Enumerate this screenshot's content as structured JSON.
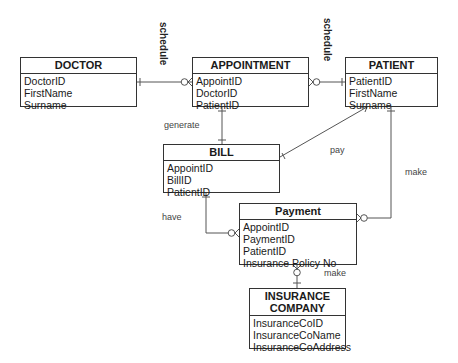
{
  "diagram": {
    "type": "entity-relationship",
    "entities": [
      {
        "id": "doctor",
        "title": "DOCTOR",
        "attributes": [
          "DoctorID",
          "FirstName",
          "Surname"
        ]
      },
      {
        "id": "appointment",
        "title": "APPOINTMENT",
        "attributes": [
          "AppointID",
          "DoctorID",
          "PatientID"
        ]
      },
      {
        "id": "patient",
        "title": "PATIENT",
        "attributes": [
          "PatientID",
          "FirstName",
          "Surname"
        ]
      },
      {
        "id": "bill",
        "title": "BILL",
        "attributes": [
          "AppointID",
          "BillID",
          "PatientID"
        ]
      },
      {
        "id": "payment",
        "title": "Payment",
        "attributes": [
          "AppointID",
          "PaymentID",
          "PatientID",
          "Insurance Policy No"
        ]
      },
      {
        "id": "insurance",
        "title_line1": "INSURANCE",
        "title_line2": "COMPANY",
        "attributes": [
          "InsuranceCoID",
          "InsuranceCoName",
          "InsuranceCoAddress"
        ]
      }
    ],
    "relationships": [
      {
        "label": "schedule",
        "from": "DOCTOR",
        "to": "APPOINTMENT",
        "from_card": "one",
        "to_card": "zero-or-many"
      },
      {
        "label": "schedule",
        "from": "PATIENT",
        "to": "APPOINTMENT",
        "from_card": "one",
        "to_card": "zero-or-many"
      },
      {
        "label": "generate",
        "from": "APPOINTMENT",
        "to": "BILL",
        "from_card": "one",
        "to_card": "one"
      },
      {
        "label": "pay",
        "from": "PATIENT",
        "to": "BILL",
        "from_card": "many",
        "to_card": "one"
      },
      {
        "label": "make",
        "from": "PATIENT",
        "to": "Payment",
        "from_card": "one",
        "to_card": "zero-or-many"
      },
      {
        "label": "have",
        "from": "BILL",
        "to": "Payment",
        "from_card": "one",
        "to_card": "zero-or-many"
      },
      {
        "label": "make",
        "from": "INSURANCE COMPANY",
        "to": "Payment",
        "from_card": "one",
        "to_card": "zero-or-many"
      }
    ]
  },
  "labels": {
    "schedule_left": "schedule",
    "schedule_right": "schedule",
    "generate": "generate",
    "pay": "pay",
    "make_patient": "make",
    "have": "have",
    "make_insurance": "make"
  }
}
